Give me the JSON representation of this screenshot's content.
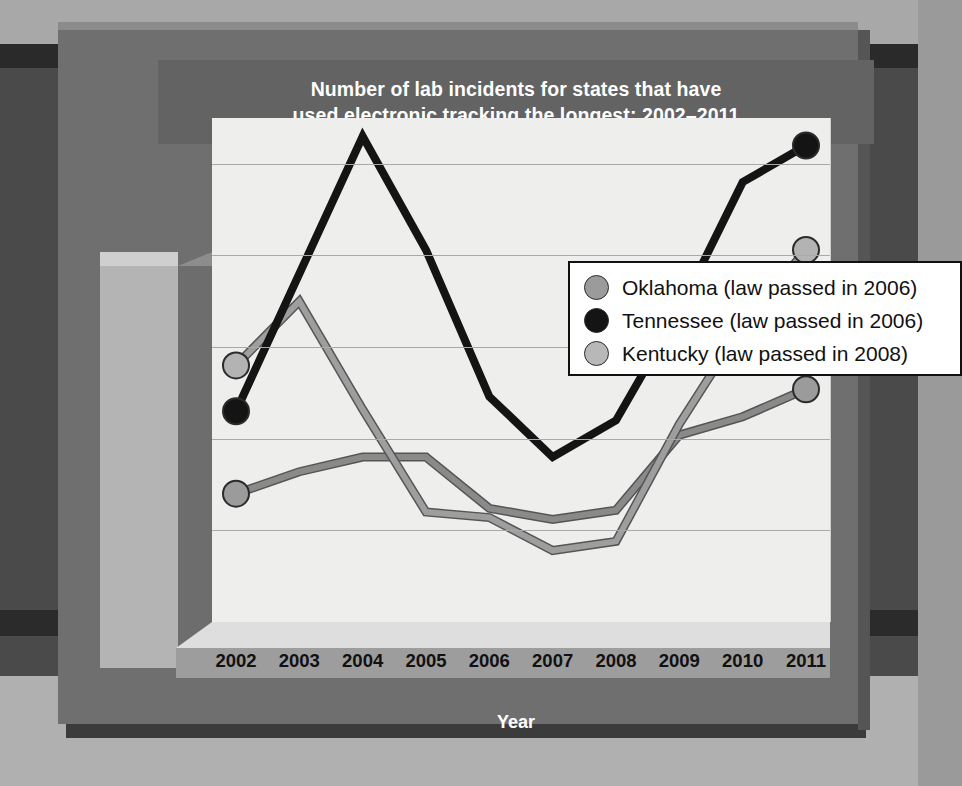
{
  "chart_data": {
    "type": "line",
    "title": "Number of lab incidents for states that have used electronic tracking the longest: 2002–2011",
    "title_line1": "Number of lab incidents for states that have",
    "title_line2": "used electronic tracking the longest: 2002–2011",
    "xlabel": "Year",
    "ylabel": "",
    "categories": [
      "2002",
      "2003",
      "2004",
      "2005",
      "2006",
      "2007",
      "2008",
      "2009",
      "2010",
      "2011"
    ],
    "x": [
      2002,
      2003,
      2004,
      2005,
      2006,
      2007,
      2008,
      2009,
      2010,
      2011
    ],
    "ylim": [
      0,
      2750
    ],
    "yticks": [
      0,
      500,
      1000,
      1500,
      2000,
      2500
    ],
    "ytick_labels": [
      "0",
      "500",
      "1,000",
      "1,500",
      "2,000",
      "2,500"
    ],
    "grid": true,
    "legend_position": "top-right",
    "series": [
      {
        "name": "Oklahoma (law passed in 2006)",
        "short_name": "Oklahoma",
        "color": "#8a8a8a",
        "marker_color": "#9b9b9b",
        "values": [
          700,
          820,
          900,
          900,
          620,
          560,
          610,
          1020,
          1120,
          1270
        ],
        "markers_at": [
          "2002",
          "2011"
        ]
      },
      {
        "name": "Tennessee (law passed in 2006)",
        "short_name": "Tennessee",
        "color": "#141414",
        "marker_color": "#141414",
        "values": [
          1150,
          1900,
          2650,
          2030,
          1230,
          900,
          1100,
          1700,
          2400,
          2600
        ],
        "markers_at": [
          "2002",
          "2011"
        ]
      },
      {
        "name": "Kentucky (law passed in 2008)",
        "short_name": "Kentucky",
        "color": "#9e9e9e",
        "marker_color": "#b3b3b3",
        "values": [
          1400,
          1750,
          1160,
          600,
          570,
          390,
          440,
          1080,
          1620,
          2030
        ],
        "markers_at": [
          "2002",
          "2011"
        ]
      }
    ]
  },
  "legend": {
    "items": [
      {
        "label": "Oklahoma (law passed in 2006)",
        "swatch": "#9b9b9b"
      },
      {
        "label": "Tennessee (law passed in 2006)",
        "swatch": "#141414"
      },
      {
        "label": "Kentucky (law passed in 2008)",
        "swatch": "#b8b8b8"
      }
    ]
  },
  "colors": {
    "panel": "#6f6f6f",
    "title_band": "#636363",
    "plot_background": "#eeeeec",
    "gridline": "#a9a9a9",
    "axis_slab": "#b4b4b4",
    "floor": "#9d9d9d"
  }
}
